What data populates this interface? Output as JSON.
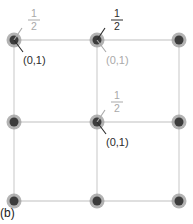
{
  "caption": "(b)",
  "grid": {
    "rows": 3,
    "cols": 3,
    "colors": {
      "line": "#d4d4d4",
      "node_halo": "#9a9a9a",
      "node_core": "#3c3c3c"
    }
  },
  "annotations": [
    {
      "node": [
        0,
        0
      ],
      "fraction": {
        "num": "1",
        "den": "2",
        "tone": "light"
      },
      "coord": {
        "text": "(0,1)",
        "tone": "dark"
      }
    },
    {
      "node": [
        1,
        0
      ],
      "fraction": {
        "num": "1",
        "den": "2",
        "tone": "dark"
      },
      "coord": {
        "text": "(0,1)",
        "tone": "light"
      }
    },
    {
      "node": [
        1,
        1
      ],
      "fraction": {
        "num": "1",
        "den": "2",
        "tone": "light"
      },
      "coord": {
        "text": "(0,1)",
        "tone": "dark"
      }
    }
  ],
  "tones": {
    "dark": "#2b2b2b",
    "light": "#a9a9a9"
  }
}
